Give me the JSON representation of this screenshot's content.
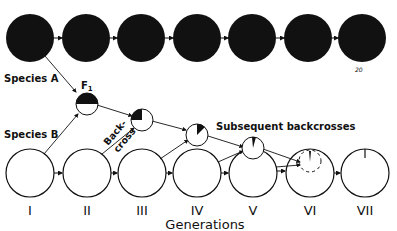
{
  "diagram": {
    "labels": {
      "species_a": "Species A",
      "species_b": "Species B",
      "f1": "F",
      "f1_sub": "1",
      "backcross_line1": "Back-",
      "backcross_line2": "cross",
      "subsequent": "Subsequent backcrosses",
      "axis_title": "Generations",
      "corner_mark": "20"
    },
    "generations": [
      "I",
      "II",
      "III",
      "IV",
      "V",
      "VI",
      "VII"
    ],
    "species_a_row": {
      "count": 7,
      "fill": "#111111"
    },
    "species_b_row": {
      "count": 7,
      "fill": "#ffffff",
      "stroke": "#111111"
    },
    "hybrids": [
      {
        "name": "F1",
        "species_a_fraction": 0.5
      },
      {
        "name": "Backcross 1",
        "species_a_fraction": 0.25
      },
      {
        "name": "Backcross 2",
        "species_a_fraction": 0.125
      },
      {
        "name": "Backcross 3",
        "species_a_fraction": 0.0625
      }
    ],
    "colors": {
      "ink": "#111111",
      "paper": "#ffffff"
    }
  }
}
